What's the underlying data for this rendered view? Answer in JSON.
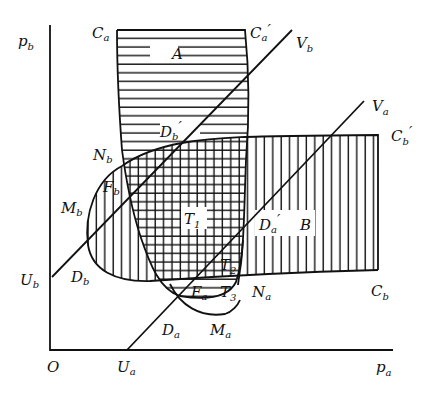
{
  "diagram": {
    "type": "region-diagram",
    "axes": {
      "x_label": {
        "main": "p",
        "sub": "a"
      },
      "y_label": {
        "main": "p",
        "sub": "b"
      },
      "origin": "O"
    },
    "labels": {
      "Ca": {
        "main": "C",
        "sub": "a",
        "prime": ""
      },
      "Ca_prime": {
        "main": "C",
        "sub": "a",
        "prime": "′"
      },
      "Cb": {
        "main": "C",
        "sub": "b",
        "prime": ""
      },
      "Cb_prime": {
        "main": "C",
        "sub": "b",
        "prime": "′"
      },
      "Va": {
        "main": "V",
        "sub": "a",
        "prime": ""
      },
      "Vb": {
        "main": "V",
        "sub": "b",
        "prime": ""
      },
      "Ua": {
        "main": "U",
        "sub": "a",
        "prime": ""
      },
      "Ub": {
        "main": "U",
        "sub": "b",
        "prime": ""
      },
      "Na": {
        "main": "N",
        "sub": "a",
        "prime": ""
      },
      "Nb": {
        "main": "N",
        "sub": "b",
        "prime": ""
      },
      "Ma": {
        "main": "M",
        "sub": "a",
        "prime": ""
      },
      "Mb": {
        "main": "M",
        "sub": "b",
        "prime": ""
      },
      "Da": {
        "main": "D",
        "sub": "a",
        "prime": ""
      },
      "Db": {
        "main": "D",
        "sub": "b",
        "prime": ""
      },
      "Da_prime": {
        "main": "D",
        "sub": "a",
        "prime": "′"
      },
      "Db_prime": {
        "main": "D",
        "sub": "b",
        "prime": "′"
      },
      "Fa": {
        "main": "F",
        "sub": "a",
        "prime": ""
      },
      "Fb": {
        "main": "F",
        "sub": "b",
        "prime": ""
      },
      "T1": {
        "main": "T",
        "sub": "1",
        "prime": ""
      },
      "T2": {
        "main": "T",
        "sub": "2",
        "prime": ""
      },
      "T3": {
        "main": "T",
        "sub": "3",
        "prime": ""
      },
      "A": {
        "main": "A",
        "sub": "",
        "prime": ""
      },
      "B": {
        "main": "B",
        "sub": "",
        "prime": ""
      }
    },
    "regions": {
      "A": "horizontal hatching (bounded by Ca, Ca′)",
      "B": "vertical hatching (bounded by Cb, Cb′)",
      "T1": "cross hatching (overlap of A and B)"
    },
    "colors": {
      "ink": "#111111",
      "background": "#ffffff"
    }
  }
}
